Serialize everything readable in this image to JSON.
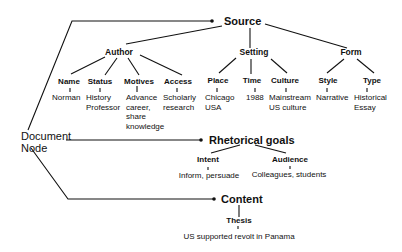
{
  "diagram": {
    "root": {
      "label_line1": "Document",
      "label_line2": "Node"
    },
    "branches": {
      "source": {
        "label": "Source",
        "groups": {
          "author": {
            "label": "Author",
            "attributes": [
              {
                "label": "Name",
                "value": "Norman"
              },
              {
                "label": "Status",
                "value": "History\nProfessor"
              },
              {
                "label": "Motives",
                "value": "Advance\ncareer,\nshare\nknowledge"
              },
              {
                "label": "Access",
                "value": "Scholarly\nresearch"
              }
            ]
          },
          "setting": {
            "label": "Setting",
            "attributes": [
              {
                "label": "Place",
                "value": "Chicago\nUSA"
              },
              {
                "label": "Time",
                "value": "1988"
              },
              {
                "label": "Culture",
                "value": "Mainstream\nUS culture"
              }
            ]
          },
          "form": {
            "label": "Form",
            "attributes": [
              {
                "label": "Style",
                "value": "Narrative"
              },
              {
                "label": "Type",
                "value": "Historical\nEssay"
              }
            ]
          }
        }
      },
      "rhetorical_goals": {
        "label": "Rhetorical goals",
        "attributes": [
          {
            "label": "Intent",
            "value": "Inform, persuade"
          },
          {
            "label": "Audience",
            "value": "Colleagues, students"
          }
        ]
      },
      "content": {
        "label": "Content",
        "attributes": [
          {
            "label": "Thesis",
            "value": "US supported revolt in Panama"
          }
        ]
      }
    }
  }
}
